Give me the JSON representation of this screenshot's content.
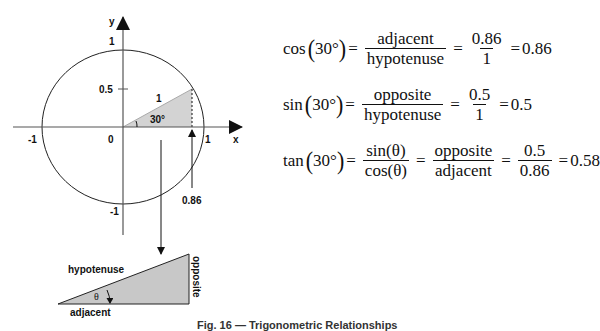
{
  "unit_circle": {
    "axis_x_label": "x",
    "axis_y_label": "y",
    "tick_labels": {
      "x_neg": "-1",
      "x_pos": "1",
      "origin": "0",
      "y_pos": "1",
      "y_neg": "-1",
      "y_half": "0.5"
    },
    "hypotenuse_label": "1",
    "angle_label": "30°",
    "cos_value_label": "0.86",
    "shade_color": "#d3d3d3"
  },
  "triangle": {
    "hypotenuse": "hypotenuse",
    "opposite": "opposite",
    "adjacent": "adjacent",
    "angle": "θ"
  },
  "formulas": {
    "cos": {
      "fn": "cos",
      "arg": "30°",
      "num1": "adjacent",
      "den1": "hypotenuse",
      "num2": "0.86",
      "den2": "1",
      "result": "0.86"
    },
    "sin": {
      "fn": "sin",
      "arg": "30°",
      "num1": "opposite",
      "den1": "hypotenuse",
      "num2": "0.5",
      "den2": "1",
      "result": "0.5"
    },
    "tan": {
      "fn": "tan",
      "arg": "30°",
      "num0": "sin(θ)",
      "den0": "cos(θ)",
      "num1": "opposite",
      "den1": "adjacent",
      "num2": "0.5",
      "den2": "0.86",
      "result": "0.58"
    }
  },
  "caption": "Fig. 16 — Trigonometric Relationships"
}
